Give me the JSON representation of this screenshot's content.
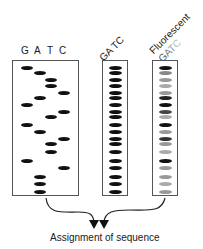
{
  "gel1": {
    "lane_labels": [
      "G",
      "A",
      "T",
      "C"
    ],
    "bands": [
      {
        "lane": "G",
        "y": 67
      },
      {
        "lane": "A",
        "y": 72
      },
      {
        "lane": "T",
        "y": 79
      },
      {
        "lane": "T",
        "y": 85
      },
      {
        "lane": "C",
        "y": 92
      },
      {
        "lane": "A",
        "y": 97
      },
      {
        "lane": "G",
        "y": 104
      },
      {
        "lane": "C",
        "y": 111
      },
      {
        "lane": "T",
        "y": 116
      },
      {
        "lane": "G",
        "y": 124
      },
      {
        "lane": "A",
        "y": 131
      },
      {
        "lane": "C",
        "y": 138
      },
      {
        "lane": "T",
        "y": 143
      },
      {
        "lane": "T",
        "y": 151
      },
      {
        "lane": "G",
        "y": 160
      },
      {
        "lane": "C",
        "y": 167
      },
      {
        "lane": "A",
        "y": 176
      },
      {
        "lane": "A",
        "y": 183
      },
      {
        "lane": "A",
        "y": 191
      }
    ]
  },
  "gel2": {
    "label": "GA TC",
    "band_count": 19
  },
  "gel3": {
    "label_line1": "Fluorescent",
    "label_line2_letters": [
      {
        "char": "G",
        "color": "#555555"
      },
      {
        "char": "A",
        "color": "#777777"
      },
      {
        "char": "T",
        "color": "#999999"
      },
      {
        "char": "C",
        "color": "#bbbbbb"
      }
    ],
    "band_colors": [
      "#111111",
      "#888888",
      "#999999",
      "#aaaaaa",
      "#999999",
      "#222222",
      "#111111",
      "#444444",
      "#aaaaaa",
      "#111111",
      "#999999",
      "#333333",
      "#999999",
      "#aaaaaa",
      "#111111",
      "#999999",
      "#999999",
      "#aaaaaa",
      "#999999"
    ]
  },
  "caption": "Assignment of sequence"
}
